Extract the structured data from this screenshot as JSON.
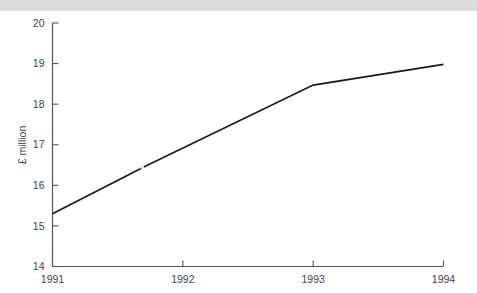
{
  "page": {
    "background_color": "#ffffff",
    "scan_margin_color": "#dcdcdc"
  },
  "chart_data": {
    "type": "line",
    "title": "",
    "subtitle": "",
    "xlabel": "",
    "ylabel": "£ million",
    "xlim": [
      1991,
      1994
    ],
    "ylim": [
      14,
      20
    ],
    "grid": false,
    "legend": null,
    "x_tick_labels": [
      "1991",
      "1992",
      "1993",
      "1994"
    ],
    "x_ticks": [
      1991,
      1992,
      1993,
      1994
    ],
    "y_tick_labels": [
      "14",
      "15",
      "16",
      "17",
      "18",
      "19",
      "20"
    ],
    "y_ticks": [
      14,
      15,
      16,
      17,
      18,
      19,
      20
    ],
    "series": [
      {
        "name": "£ million",
        "color": "#1a1a1a",
        "x": [
          1991,
          1991.7,
          1993,
          1994
        ],
        "values": [
          15.3,
          16.45,
          18.47,
          18.98
        ]
      }
    ],
    "annotations": [
      {
        "name": "line-break-marker",
        "x": 1991.68,
        "y": 16.42,
        "note": "small gap / splice mark in the plotted line"
      }
    ]
  },
  "axis": {
    "y_title": "£ million",
    "x_title": ""
  },
  "labels": {
    "y": [
      "20",
      "19",
      "18",
      "17",
      "16",
      "15",
      "14"
    ],
    "x": [
      "1991",
      "1992",
      "1993",
      "1994"
    ]
  }
}
